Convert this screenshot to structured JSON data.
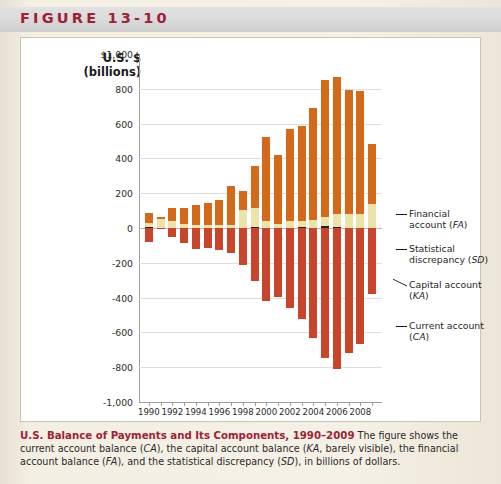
{
  "figure": {
    "label": "FIGURE 13-10"
  },
  "axis_title": {
    "line1": "U.S. $",
    "line2": "(billions)"
  },
  "callouts": [
    {
      "key": "fa",
      "line1": "Financial",
      "line2": "account (FA)",
      "italic": "FA"
    },
    {
      "key": "sd",
      "line1": "Statistical",
      "line2": "discrepancy (SD)",
      "italic": "SD"
    },
    {
      "key": "ka",
      "line1": "Capital account",
      "line2": "(KA)",
      "italic": "KA"
    },
    {
      "key": "ca",
      "line1": "Current account",
      "line2": "(CA)",
      "italic": "CA"
    }
  ],
  "caption": {
    "title": "U.S. Balance of Payments and Its Components, 1990–2009",
    "body_1": " The figure shows the current account balance (",
    "ca": "CA",
    "body_2": "), the capital account balance (",
    "ka": "KA",
    "body_3": ", barely visible), the financial account balance (",
    "fa": "FA",
    "body_4": "), and the statistical discrepancy (",
    "sd": "SD",
    "body_5": "), in billions of dollars."
  },
  "colors": {
    "financial_account": "#d4691a",
    "statistical_discrepancy": "#ece3a8",
    "capital_account": "#2d1a10",
    "current_account": "#c8442a",
    "figure_label": "#9d2235",
    "caption_title": "#9d2235",
    "gridline": "#dedede",
    "axis": "#9c9c9c",
    "card_background": "#ffffff",
    "page_background": "#f2ece0"
  },
  "chart_data": {
    "type": "bar",
    "subtype": "stacked-diverging",
    "title": "U.S. Balance of Payments and Its Components, 1990–2009",
    "xlabel": "",
    "ylabel": "U.S. $ (billions)",
    "ylim": [
      -1000,
      1000
    ],
    "grid": true,
    "legend_position": "right-callouts",
    "ytick_labels": [
      "$1,000",
      "800",
      "600",
      "400",
      "200",
      "0",
      "-200",
      "-400",
      "-600",
      "-800",
      "-1,000"
    ],
    "ytick_values": [
      1000,
      800,
      600,
      400,
      200,
      0,
      -200,
      -400,
      -600,
      -800,
      -1000
    ],
    "categories": [
      1990,
      1991,
      1992,
      1993,
      1994,
      1995,
      1996,
      1997,
      1998,
      1999,
      2000,
      2001,
      2002,
      2003,
      2004,
      2005,
      2006,
      2007,
      2008,
      2009
    ],
    "xtick_labels": [
      "1990",
      "1992",
      "1994",
      "1996",
      "1998",
      "2000",
      "2002",
      "2004",
      "2006",
      "2008"
    ],
    "series": [
      {
        "name": "Financial account (FA)",
        "color": "#d4691a",
        "values": [
          58,
          15,
          73,
          94,
          112,
          128,
          146,
          225,
          112,
          242,
          480,
          400,
          526,
          543,
          645,
          787,
          786,
          710,
          708,
          340
        ]
      },
      {
        "name": "Statistical discrepancy (SD)",
        "color": "#ece3a8",
        "values": [
          22,
          50,
          42,
          20,
          18,
          16,
          14,
          14,
          100,
          108,
          42,
          20,
          42,
          40,
          42,
          48,
          78,
          80,
          80,
          140
        ]
      },
      {
        "name": "Capital account (KA)",
        "color": "#2d1a10",
        "values": [
          7,
          0,
          1,
          1,
          1,
          1,
          1,
          1,
          1,
          5,
          1,
          1,
          1,
          3,
          2,
          13,
          4,
          2,
          1,
          0
        ]
      },
      {
        "name": "Current account (CA)",
        "color": "#c8442a",
        "values": [
          -79,
          -3,
          -50,
          -85,
          -122,
          -114,
          -125,
          -141,
          -215,
          -302,
          -417,
          -399,
          -459,
          -522,
          -632,
          -749,
          -812,
          -718,
          -669,
          -378
        ]
      }
    ]
  }
}
